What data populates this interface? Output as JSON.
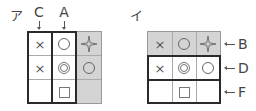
{
  "panels": [
    {
      "label": "ア",
      "column_labels": [
        {
          "text": "C",
          "col": 0
        },
        {
          "text": "A",
          "col": 1
        }
      ],
      "highlight": "column 3 shaded; columns 1 and 2 each outlined with thick border",
      "grid": [
        [
          "×",
          "○",
          "✦"
        ],
        [
          "×",
          "◎",
          "○"
        ],
        [
          "",
          "□",
          ""
        ]
      ]
    },
    {
      "label": "イ",
      "row_labels": [
        {
          "text": "B",
          "row": 0
        },
        {
          "text": "D",
          "row": 1
        },
        {
          "text": "F",
          "row": 2
        }
      ],
      "highlight": "row 1 shaded; rows 2 and 3 each outlined with thick border",
      "grid": [
        [
          "×",
          "○",
          "✦"
        ],
        [
          "×",
          "◎",
          "○"
        ],
        [
          "",
          "□",
          ""
        ]
      ]
    }
  ],
  "colors": {
    "shade": "#d4d4d4",
    "thick_border": "#2a2a2a",
    "thin_line": "#aaaaaa"
  },
  "symbols": {
    "x": "×",
    "circle": "circle-icon",
    "double_circle": "double-circle-icon",
    "square": "square-icon",
    "sparkle": "sparkle-icon"
  }
}
